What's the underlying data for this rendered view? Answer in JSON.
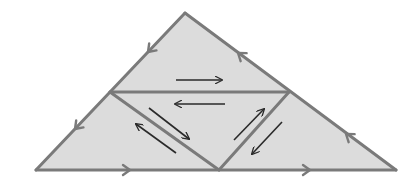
{
  "diagram": {
    "colors": {
      "fill": "#dcdcdc",
      "edge": "#7a7a7a",
      "arrow": "#2a2a2a",
      "background": "#ffffff"
    },
    "vertices": {
      "apex": [
        185,
        13
      ],
      "left_base": [
        36,
        170
      ],
      "right_base": [
        396,
        170
      ],
      "left_mid": [
        110,
        92
      ],
      "right_mid": [
        289,
        92
      ],
      "base_mid": [
        219,
        170
      ]
    },
    "regions": [
      {
        "name": "top-triangle",
        "points": "185,13 289,92 110,92"
      },
      {
        "name": "left-triangle",
        "points": "110,92 219,170 36,170"
      },
      {
        "name": "center-triangle",
        "points": "110,92 289,92 219,170"
      },
      {
        "name": "right-triangle",
        "points": "289,92 396,170 219,170"
      }
    ],
    "edges": [
      {
        "name": "left-outer-edge",
        "x1": 185,
        "y1": 13,
        "x2": 36,
        "y2": 170
      },
      {
        "name": "right-outer-edge",
        "x1": 185,
        "y1": 13,
        "x2": 396,
        "y2": 170
      },
      {
        "name": "base-edge",
        "x1": 36,
        "y1": 170,
        "x2": 396,
        "y2": 170
      },
      {
        "name": "middle-horizontal-edge",
        "x1": 110,
        "y1": 92,
        "x2": 289,
        "y2": 92
      },
      {
        "name": "inner-left-diagonal-edge",
        "x1": 110,
        "y1": 92,
        "x2": 219,
        "y2": 170
      },
      {
        "name": "inner-right-diagonal-edge",
        "x1": 289,
        "y1": 92,
        "x2": 219,
        "y2": 170
      }
    ],
    "edge_arrowheads": [
      {
        "name": "left-edge-upper-arrowhead",
        "at": [
          148,
          52
        ],
        "direction": "down-left"
      },
      {
        "name": "left-edge-lower-arrowhead",
        "at": [
          75,
          129
        ],
        "direction": "down-left"
      },
      {
        "name": "right-edge-upper-arrowhead",
        "at": [
          238,
          53
        ],
        "direction": "up-left"
      },
      {
        "name": "right-edge-lower-arrowhead",
        "at": [
          346,
          134
        ],
        "direction": "up-left"
      },
      {
        "name": "base-left-arrowhead",
        "at": [
          130,
          170
        ],
        "direction": "right"
      },
      {
        "name": "base-right-arrowhead",
        "at": [
          310,
          170
        ],
        "direction": "right"
      }
    ],
    "inner_arrows": [
      {
        "name": "top-triangle-right-arrow",
        "x1": 176,
        "y1": 80,
        "x2": 222,
        "y2": 80
      },
      {
        "name": "center-triangle-left-arrow",
        "x1": 225,
        "y1": 104,
        "x2": 175,
        "y2": 104
      },
      {
        "name": "center-triangle-down-right-arrow",
        "x1": 149,
        "y1": 108,
        "x2": 189,
        "y2": 139
      },
      {
        "name": "left-triangle-up-left-arrow",
        "x1": 176,
        "y1": 153,
        "x2": 136,
        "y2": 124
      },
      {
        "name": "center-triangle-up-right-arrow",
        "x1": 234,
        "y1": 140,
        "x2": 264,
        "y2": 109
      },
      {
        "name": "right-triangle-down-left-arrow",
        "x1": 282,
        "y1": 122,
        "x2": 252,
        "y2": 154
      }
    ]
  }
}
